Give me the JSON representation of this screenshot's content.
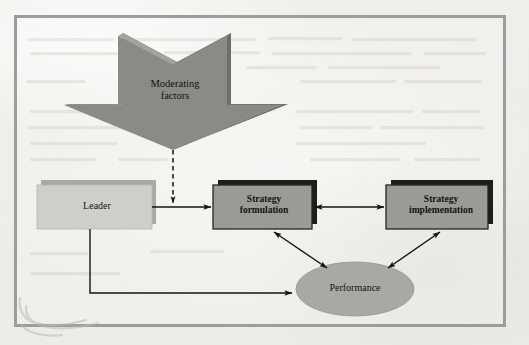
{
  "figure": {
    "background_color": "#efeeea",
    "frame_color": "#9d9d9b"
  },
  "palette": {
    "arrow_block_fill": "#8a8a86",
    "arrow_block_bevel_light": "#9a9a96",
    "arrow_block_bevel_dark": "#6f6f6c",
    "light_box_fill": "#cfcfca",
    "light_box_back": "#a8a8a3",
    "dark_box_fill": "#9a9a96",
    "dark_box_back": "#1d1d1b",
    "ellipse_fill": "#a9a9a4",
    "line_color": "#161513",
    "text_color": "#14120f"
  },
  "nodes": [
    {
      "id": "moderating-factors",
      "label": "Moderating\nfactors",
      "shape": "block-arrow-down",
      "bold": false
    },
    {
      "id": "leader",
      "label": "Leader",
      "shape": "rectangle-light",
      "bold": false
    },
    {
      "id": "strategy-formulation",
      "label": "Strategy\nformulation",
      "shape": "rectangle-shadowed",
      "bold": true
    },
    {
      "id": "strategy-implementation",
      "label": "Strategy\nimplementation",
      "shape": "rectangle-shadowed",
      "bold": true
    },
    {
      "id": "performance",
      "label": "Performance",
      "shape": "ellipse",
      "bold": false
    }
  ],
  "connectors": [
    {
      "id": "moderating-to-link",
      "from": "moderating-factors",
      "to": "leader-to-strategy-link",
      "style": "dashed",
      "arrowheads": "end"
    },
    {
      "id": "leader-to-strategy-formulation",
      "from": "leader",
      "to": "strategy-formulation",
      "style": "solid",
      "arrowheads": "end"
    },
    {
      "id": "formulation-to-implementation",
      "from": "strategy-formulation",
      "to": "strategy-implementation",
      "style": "solid",
      "arrowheads": "both"
    },
    {
      "id": "formulation-to-performance",
      "from": "strategy-formulation",
      "to": "performance",
      "style": "solid",
      "arrowheads": "both"
    },
    {
      "id": "implementation-to-performance",
      "from": "strategy-implementation",
      "to": "performance",
      "style": "solid",
      "arrowheads": "both"
    },
    {
      "id": "leader-to-performance",
      "from": "leader",
      "to": "performance",
      "style": "solid-elbow",
      "arrowheads": "end"
    }
  ]
}
